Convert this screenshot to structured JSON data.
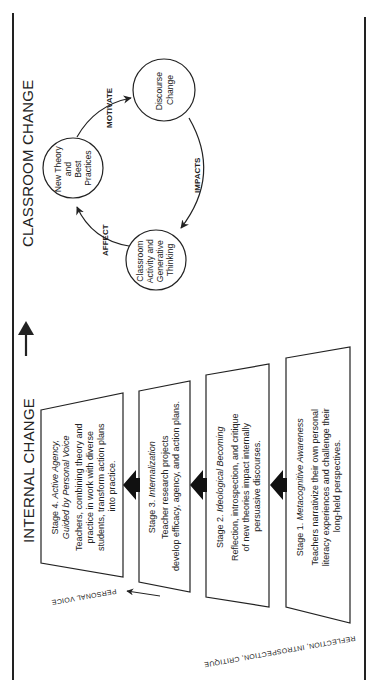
{
  "classroom_change": {
    "heading": "CLASSROOM CHANGE",
    "nodes": [
      {
        "id": "new-theory",
        "lines": [
          "New Theory",
          "and",
          "Best",
          "Practices"
        ]
      },
      {
        "id": "discourse-change",
        "lines": [
          "Discourse",
          "Change"
        ]
      },
      {
        "id": "classroom-activity",
        "lines": [
          "Classroom",
          "Activity and",
          "Generative",
          "Thinking"
        ]
      }
    ],
    "edges": [
      {
        "from": "new-theory",
        "to": "discourse-change",
        "label": "MOTIVATE"
      },
      {
        "from": "discourse-change",
        "to": "classroom-activity",
        "label": "IMPACTS"
      },
      {
        "from": "classroom-activity",
        "to": "new-theory",
        "label": "AFFECT"
      }
    ]
  },
  "internal_change": {
    "heading": "INTERNAL CHANGE",
    "stages": [
      {
        "number": "Stage 4.",
        "title_lines": [
          "Active Agency,",
          "Guided by Personal Voice"
        ],
        "body_lines": [
          "Teachers, combining theory and",
          "practice in work with diverse",
          "students, transform action plans",
          "into practice."
        ]
      },
      {
        "number": "Stage 3.",
        "title_lines": [
          "Internalization"
        ],
        "body_lines": [
          "Teacher research projects",
          "develop efficacy, agency, and action plans."
        ]
      },
      {
        "number": "Stage 2.",
        "title_lines": [
          "Ideological Becoming"
        ],
        "body_lines": [
          "Reflection, introspection, and critique",
          "of new theories impact internally",
          "persuasive discourses."
        ]
      },
      {
        "number": "Stage 1.",
        "title_lines": [
          "Metacognitive Awareness"
        ],
        "body_lines": [
          "Teachers narrativize their own personal",
          "literacy experiences and challenge their",
          "long-held perspectives."
        ]
      }
    ],
    "side_labels": {
      "process": "REFLECTION, INTROSPECTION, CRITIQUE",
      "outcome": "PERSONAL VOICE"
    }
  },
  "colors": {
    "ink": "#222222",
    "background": "#ffffff"
  }
}
